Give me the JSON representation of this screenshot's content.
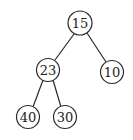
{
  "diagram": {
    "type": "binary-tree",
    "nodes": [
      {
        "id": "n15",
        "label": "15",
        "cx": 80,
        "cy": 23,
        "r": 12
      },
      {
        "id": "n23",
        "label": "23",
        "cx": 48,
        "cy": 70,
        "r": 11.5
      },
      {
        "id": "n10",
        "label": "10",
        "cx": 112,
        "cy": 72,
        "r": 11.5
      },
      {
        "id": "n40",
        "label": "40",
        "cx": 28,
        "cy": 117,
        "r": 11.5
      },
      {
        "id": "n30",
        "label": "30",
        "cx": 65,
        "cy": 117,
        "r": 11.5
      }
    ],
    "edges": [
      {
        "from": "15",
        "to": "23"
      },
      {
        "from": "15",
        "to": "10"
      },
      {
        "from": "23",
        "to": "40"
      },
      {
        "from": "23",
        "to": "30"
      }
    ]
  }
}
